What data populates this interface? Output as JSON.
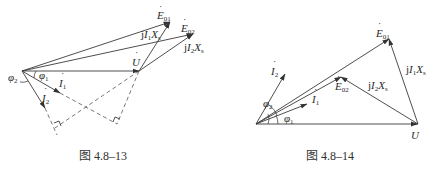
{
  "figures": [
    {
      "caption": "图 4.8–13",
      "labels": {
        "E01": {
          "main": "E",
          "sub": "01"
        },
        "E02": {
          "main": "E",
          "sub": "02"
        },
        "jI1Xs": {
          "pre": "j",
          "main": "I",
          "sub1": "1",
          "mid": "X",
          "sub2": "s"
        },
        "jI2Xs": {
          "pre": "j",
          "main": "I",
          "sub1": "2",
          "mid": "X",
          "sub2": "s"
        },
        "U": "U",
        "I1": {
          "main": "I",
          "sub": "1"
        },
        "I2": {
          "main": "I",
          "sub": "2"
        },
        "phi1": {
          "main": "φ",
          "sub": "1"
        },
        "phi2": {
          "main": "φ",
          "sub": "2"
        }
      }
    },
    {
      "caption": "图 4.8–14",
      "labels": {
        "E01": {
          "main": "E",
          "sub": "01"
        },
        "E02": {
          "main": "E",
          "sub": "02"
        },
        "jI1Xs": {
          "pre": "j",
          "main": "I",
          "sub1": "1",
          "mid": "X",
          "sub2": "s"
        },
        "jI2Xs": {
          "pre": "j",
          "main": "I",
          "sub1": "2",
          "mid": "X",
          "sub2": "s"
        },
        "U": "U",
        "I1": {
          "main": "I",
          "sub": "1"
        },
        "I2": {
          "main": "I",
          "sub": "2"
        },
        "phi1": {
          "main": "φ",
          "sub": "1"
        },
        "phi2": {
          "main": "φ",
          "sub": "2"
        }
      }
    }
  ],
  "dot_glyph": "˙"
}
